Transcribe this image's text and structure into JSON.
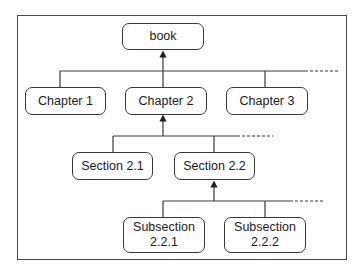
{
  "diagram": {
    "type": "tree",
    "root": "book",
    "nodes": {
      "book": {
        "label": "book"
      },
      "chapter1": {
        "label": "Chapter 1"
      },
      "chapter2": {
        "label": "Chapter 2"
      },
      "chapter3": {
        "label": "Chapter 3"
      },
      "section21": {
        "label": "Section 2.1"
      },
      "section22": {
        "label": "Section 2.2"
      },
      "subsection221": {
        "label_line1": "Subsection",
        "label_line2": "2.2.1"
      },
      "subsection222": {
        "label_line1": "Subsection",
        "label_line2": "2.2.2"
      }
    },
    "edges": [
      {
        "from": "chapter1",
        "to": "book"
      },
      {
        "from": "chapter2",
        "to": "book"
      },
      {
        "from": "chapter3",
        "to": "book"
      },
      {
        "from": "section21",
        "to": "chapter2"
      },
      {
        "from": "section22",
        "to": "chapter2"
      },
      {
        "from": "subsection221",
        "to": "section22"
      },
      {
        "from": "subsection222",
        "to": "section22"
      }
    ],
    "continuation_indicators": [
      "chapters",
      "sections",
      "subsections"
    ],
    "colors": {
      "stroke": "#3a3a3a",
      "background": "#ffffff",
      "text": "#222222"
    }
  }
}
